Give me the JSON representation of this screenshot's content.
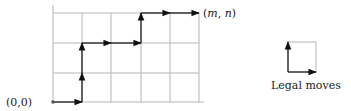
{
  "diagram": {
    "type": "lattice-path",
    "grid": {
      "columns": 5,
      "rows": 3,
      "line_color": "#b0b0b0"
    },
    "path_color": "#111111",
    "origin_label": "(0,0)",
    "end_label_m": "m",
    "end_label_n": "n",
    "end_label": "(m, n)",
    "path_moves": [
      "R",
      "U",
      "U",
      "R",
      "R",
      "U",
      "R",
      "R"
    ],
    "legend": {
      "label": "Legal moves",
      "moves": [
        "up",
        "right"
      ]
    }
  }
}
